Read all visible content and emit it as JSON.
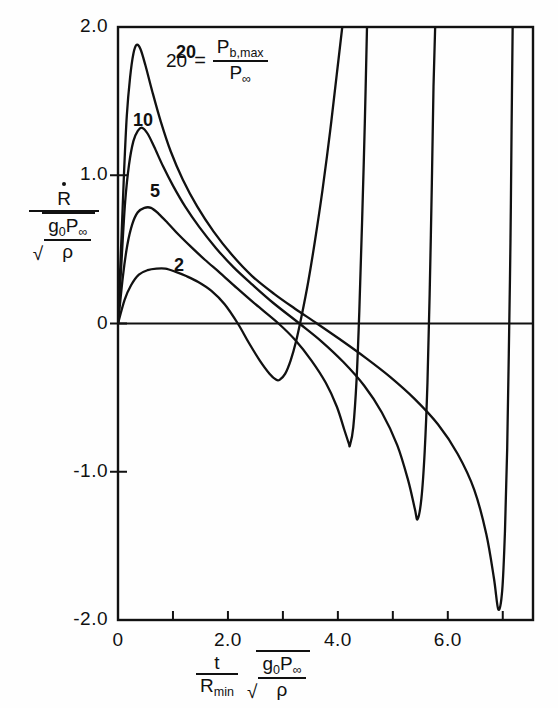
{
  "figure": {
    "kind": "scientific-line-plot",
    "background": "#fefefe",
    "ink": "#111111"
  },
  "annotation": {
    "value": "20",
    "equals": "=",
    "numerator_main": "P",
    "numerator_sub": "b,max",
    "denominator_main": "P",
    "denominator_sub": "∞"
  },
  "y_axis_title": {
    "numerator": "R",
    "radicand_num_1": "g",
    "radicand_num_1_sub": "0",
    "radicand_num_2": "P",
    "radicand_num_2_sub": "∞",
    "radicand_den": "ρ",
    "radical_sign": "√"
  },
  "x_axis_title": {
    "numerator": "t",
    "denominator_main": "R",
    "denominator_sub": "min",
    "radical_sign": "√",
    "radicand_num_1": "g",
    "radicand_num_1_sub": "0",
    "radicand_num_2": "P",
    "radicand_num_2_sub": "∞",
    "radicand_den": "ρ"
  },
  "curve_labels": [
    {
      "text": "20",
      "x_px": 176,
      "y_px": 42
    },
    {
      "text": "10",
      "x_px": 133,
      "y_px": 110
    },
    {
      "text": "5",
      "x_px": 150,
      "y_px": 181
    },
    {
      "text": "2",
      "x_px": 174,
      "y_px": 255
    }
  ],
  "chart_data": {
    "type": "line",
    "title": "",
    "xlabel": "t / R_min * sqrt(g0 P_inf / rho)",
    "ylabel": "R_dot / sqrt(g0 P_inf / rho)",
    "xlim": [
      0,
      7.55
    ],
    "ylim": [
      -2.0,
      2.0
    ],
    "grid": false,
    "legend": "inline-curve-labels",
    "xticks": [
      0,
      1.0,
      2.0,
      3.0,
      4.0,
      5.0,
      6.0,
      7.0
    ],
    "xtick_labels": [
      "0",
      "",
      "2.0",
      "",
      "4.0",
      "",
      "6.0",
      ""
    ],
    "yticks": [
      2.0,
      1.0,
      0,
      -1.0,
      -2.0
    ],
    "ytick_labels": [
      "2.0",
      "1.0",
      "0",
      "-1.0",
      "-2.0"
    ],
    "zero_line": true,
    "series": [
      {
        "name": "20",
        "pressure_ratio": 20,
        "peak": {
          "x": 0.34,
          "y": 1.88
        },
        "zero_crossing_down": 3.62,
        "minimum": {
          "x": 6.92,
          "y": -1.93
        },
        "points": [
          [
            0.0,
            0.0
          ],
          [
            0.06,
            0.55
          ],
          [
            0.11,
            1.02
          ],
          [
            0.16,
            1.4
          ],
          [
            0.22,
            1.66
          ],
          [
            0.28,
            1.82
          ],
          [
            0.34,
            1.88
          ],
          [
            0.41,
            1.85
          ],
          [
            0.5,
            1.74
          ],
          [
            0.62,
            1.57
          ],
          [
            0.78,
            1.36
          ],
          [
            0.96,
            1.16
          ],
          [
            1.18,
            0.97
          ],
          [
            1.44,
            0.79
          ],
          [
            1.74,
            0.62
          ],
          [
            2.08,
            0.46
          ],
          [
            2.44,
            0.32
          ],
          [
            2.84,
            0.2
          ],
          [
            3.22,
            0.1
          ],
          [
            3.62,
            0.0
          ],
          [
            4.05,
            -0.11
          ],
          [
            4.5,
            -0.23
          ],
          [
            4.95,
            -0.36
          ],
          [
            5.4,
            -0.51
          ],
          [
            5.82,
            -0.68
          ],
          [
            6.18,
            -0.88
          ],
          [
            6.48,
            -1.12
          ],
          [
            6.7,
            -1.42
          ],
          [
            6.84,
            -1.72
          ],
          [
            6.92,
            -1.93
          ],
          [
            6.99,
            -1.8
          ],
          [
            7.04,
            -1.4
          ],
          [
            7.08,
            -0.85
          ],
          [
            7.11,
            -0.2
          ],
          [
            7.14,
            0.55
          ],
          [
            7.16,
            1.3
          ],
          [
            7.18,
            2.0
          ]
        ]
      },
      {
        "name": "10",
        "pressure_ratio": 10,
        "peak": {
          "x": 0.44,
          "y": 1.32
        },
        "zero_crossing_down": 3.3,
        "minimum": {
          "x": 5.45,
          "y": -1.32
        },
        "points": [
          [
            0.0,
            0.0
          ],
          [
            0.07,
            0.46
          ],
          [
            0.13,
            0.82
          ],
          [
            0.2,
            1.07
          ],
          [
            0.28,
            1.23
          ],
          [
            0.36,
            1.3
          ],
          [
            0.44,
            1.32
          ],
          [
            0.54,
            1.28
          ],
          [
            0.66,
            1.19
          ],
          [
            0.82,
            1.06
          ],
          [
            1.0,
            0.93
          ],
          [
            1.22,
            0.79
          ],
          [
            1.48,
            0.65
          ],
          [
            1.78,
            0.51
          ],
          [
            2.1,
            0.38
          ],
          [
            2.45,
            0.26
          ],
          [
            2.82,
            0.14
          ],
          [
            3.3,
            0.0
          ],
          [
            3.7,
            -0.12
          ],
          [
            4.1,
            -0.26
          ],
          [
            4.48,
            -0.42
          ],
          [
            4.8,
            -0.6
          ],
          [
            5.08,
            -0.82
          ],
          [
            5.28,
            -1.06
          ],
          [
            5.4,
            -1.25
          ],
          [
            5.45,
            -1.32
          ],
          [
            5.52,
            -1.18
          ],
          [
            5.58,
            -0.86
          ],
          [
            5.63,
            -0.4
          ],
          [
            5.67,
            0.2
          ],
          [
            5.71,
            0.95
          ],
          [
            5.74,
            1.6
          ],
          [
            5.77,
            2.0
          ]
        ]
      },
      {
        "name": "5",
        "pressure_ratio": 5,
        "peak": {
          "x": 0.6,
          "y": 0.78
        },
        "zero_crossing_down": 2.92,
        "minimum": {
          "x": 4.22,
          "y": -0.82
        },
        "points": [
          [
            0.0,
            0.0
          ],
          [
            0.09,
            0.32
          ],
          [
            0.17,
            0.53
          ],
          [
            0.26,
            0.67
          ],
          [
            0.36,
            0.75
          ],
          [
            0.48,
            0.78
          ],
          [
            0.6,
            0.78
          ],
          [
            0.74,
            0.74
          ],
          [
            0.9,
            0.68
          ],
          [
            1.1,
            0.6
          ],
          [
            1.32,
            0.52
          ],
          [
            1.58,
            0.43
          ],
          [
            1.86,
            0.34
          ],
          [
            2.16,
            0.24
          ],
          [
            2.5,
            0.13
          ],
          [
            2.92,
            0.0
          ],
          [
            3.22,
            -0.11
          ],
          [
            3.52,
            -0.25
          ],
          [
            3.78,
            -0.4
          ],
          [
            3.98,
            -0.56
          ],
          [
            4.12,
            -0.72
          ],
          [
            4.2,
            -0.81
          ],
          [
            4.22,
            -0.82
          ],
          [
            4.28,
            -0.7
          ],
          [
            4.34,
            -0.38
          ],
          [
            4.39,
            0.08
          ],
          [
            4.44,
            0.68
          ],
          [
            4.49,
            1.35
          ],
          [
            4.53,
            2.0
          ]
        ]
      },
      {
        "name": "2",
        "pressure_ratio": 2,
        "peak": {
          "x": 0.86,
          "y": 0.37
        },
        "zero_crossing_down": 2.18,
        "minimum": {
          "x": 2.94,
          "y": -0.38
        },
        "points": [
          [
            0.0,
            0.0
          ],
          [
            0.12,
            0.16
          ],
          [
            0.24,
            0.26
          ],
          [
            0.38,
            0.33
          ],
          [
            0.54,
            0.36
          ],
          [
            0.7,
            0.37
          ],
          [
            0.86,
            0.37
          ],
          [
            1.04,
            0.35
          ],
          [
            1.24,
            0.32
          ],
          [
            1.46,
            0.28
          ],
          [
            1.7,
            0.22
          ],
          [
            1.94,
            0.13
          ],
          [
            2.18,
            0.0
          ],
          [
            2.38,
            -0.13
          ],
          [
            2.58,
            -0.25
          ],
          [
            2.76,
            -0.34
          ],
          [
            2.88,
            -0.38
          ],
          [
            2.94,
            -0.38
          ],
          [
            3.04,
            -0.34
          ],
          [
            3.14,
            -0.25
          ],
          [
            3.24,
            -0.12
          ],
          [
            3.34,
            0.05
          ],
          [
            3.46,
            0.28
          ],
          [
            3.58,
            0.55
          ],
          [
            3.72,
            0.9
          ],
          [
            3.86,
            1.3
          ],
          [
            3.98,
            1.68
          ],
          [
            4.08,
            2.0
          ]
        ]
      }
    ]
  }
}
